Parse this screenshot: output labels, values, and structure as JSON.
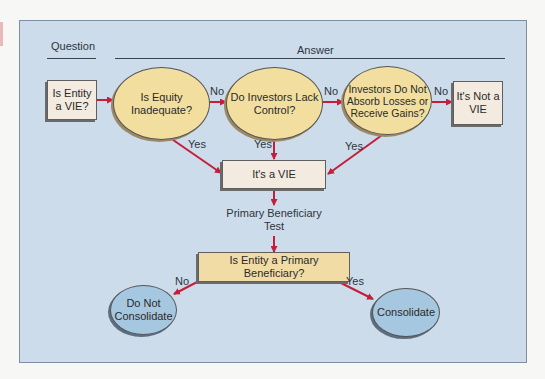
{
  "headers": {
    "question": "Question",
    "answer": "Answer"
  },
  "nodes": {
    "start": "Is Entity a VIE?",
    "q1": "Is Equity Inadequate?",
    "q2": "Do Investors Lack Control?",
    "q3": "Investors Do Not Absorb Losses or Receive Gains?",
    "not_vie": "It's Not a VIE",
    "is_vie": "It's a VIE",
    "test_label": "Primary Beneficiary Test",
    "pb_question": "Is Entity a Primary Beneficiary?",
    "do_not_consolidate": "Do Not Consolidate",
    "consolidate": "Consolidate"
  },
  "edge_labels": {
    "q1_no": "No",
    "q2_no": "No",
    "q3_no": "No",
    "q1_yes": "Yes",
    "q2_yes": "Yes",
    "q3_yes": "Yes",
    "pb_no": "No",
    "pb_yes": "Yes"
  },
  "colors": {
    "panel": "#cddcea",
    "arrow": "#c41e3a",
    "box_fill": "#f3ebdf",
    "question_ellipse": "#f2dfa0",
    "outcome_ellipse": "#a6c7e0",
    "pb_box": "#f2dca6"
  }
}
